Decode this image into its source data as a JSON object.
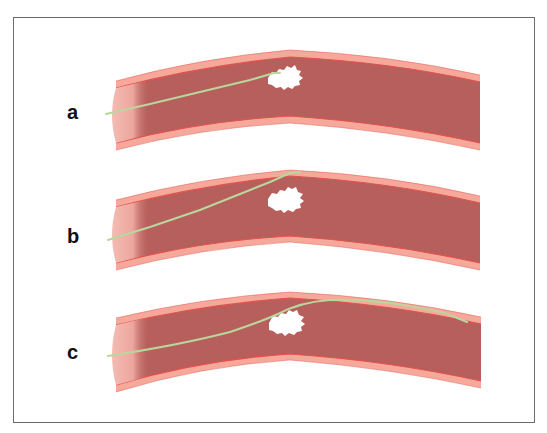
{
  "figure": {
    "panels": [
      {
        "label": "a",
        "description": "Guidewire advanced up to the clot",
        "guidewire_path": "M106,114 L150,104 L200,92 L250,80 L274,73 L280,73",
        "clot": {
          "cx": 287,
          "cy": 79
        }
      },
      {
        "label": "b",
        "description": "Guidewire deflected along vessel wall above the clot",
        "guidewire_path": "M108,240 L150,227 L200,210 L240,194 L270,182 L290,173 L300,172",
        "clot": {
          "cx": 288,
          "cy": 199
        }
      },
      {
        "label": "c",
        "description": "Guidewire passed beyond the clot",
        "guidewire_path": "M108,356 Q180,345 230,332 Q260,322 278,314 Q300,302 330,300 Q370,299 410,306 L445,313 L467,322",
        "clot": {
          "cx": 289,
          "cy": 323
        }
      }
    ],
    "colors": {
      "frame_border": "#6b6b6b",
      "vessel_wall": "#f6a89b",
      "vessel_wall_line": "#e2524b",
      "vessel_lumen": "#b75f5c",
      "vessel_opening": "#f2b6ad",
      "guidewire": "#b9d79c",
      "clot": "#ffffff",
      "label": "#111111"
    }
  }
}
